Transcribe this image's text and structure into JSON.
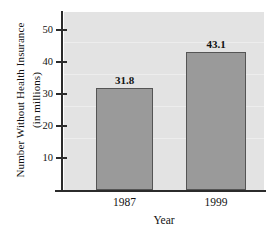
{
  "chart_data": {
    "type": "bar",
    "title": "",
    "categories": [
      "1987",
      "1999"
    ],
    "values": [
      31.8,
      43.1
    ],
    "value_labels": [
      "31.8",
      "43.1"
    ],
    "xlabel": "Year",
    "ylabel_line1": "Number Without Health Insurance",
    "ylabel_line2": "(in millions)",
    "ylabel": "Number Without Health Insurance (in millions)",
    "ylim": [
      0,
      55
    ],
    "yticks": [
      10,
      20,
      30,
      40,
      50
    ],
    "ytick_labels": [
      "10",
      "20",
      "30",
      "40",
      "50"
    ],
    "grid": false,
    "legend": "none",
    "colors": {
      "bar_fill": "#9a9a9a",
      "bar_stroke": "#555555",
      "plot_background": "#e3e3e3",
      "axis": "#2b2b2b",
      "text": "#121212",
      "page_background": "#ffffff"
    }
  }
}
